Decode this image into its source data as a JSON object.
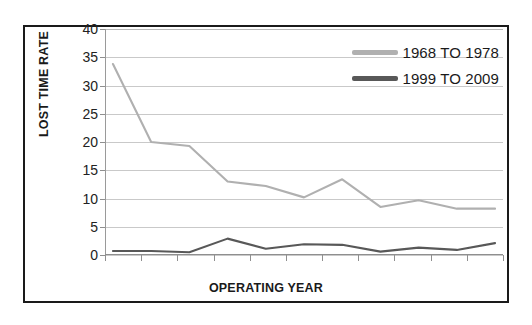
{
  "chart_data": {
    "type": "line",
    "title": "",
    "xlabel": "OPERATING YEAR",
    "ylabel": "LOST TIME RATE",
    "ylim": [
      0,
      40
    ],
    "ytick_values": [
      0,
      5,
      10,
      15,
      20,
      25,
      30,
      35,
      40
    ],
    "ytick_labels": [
      "0",
      "5",
      "10",
      "15",
      "20",
      "25",
      "30",
      "35",
      "40"
    ],
    "grid": true,
    "grid_axis": "y",
    "legend_position": "top-right",
    "x": [
      1,
      2,
      3,
      4,
      5,
      6,
      7,
      8,
      9,
      10,
      11
    ],
    "xtick_labels": [
      "",
      "",
      "",
      "",
      "",
      "",
      "",
      "",
      "",
      "",
      ""
    ],
    "series": [
      {
        "name": "1968 TO 1978",
        "color": "#b0b0b0",
        "values": [
          33.8,
          20.0,
          19.3,
          13.0,
          12.2,
          10.2,
          13.4,
          8.5,
          9.7,
          8.2,
          8.2
        ]
      },
      {
        "name": "1999 TO 2009",
        "color": "#585858",
        "values": [
          0.7,
          0.7,
          0.5,
          2.9,
          1.1,
          1.9,
          1.8,
          0.6,
          1.3,
          0.9,
          2.1
        ]
      }
    ]
  },
  "legend": {
    "items": [
      {
        "label": "1968 TO 1978",
        "color": "#b0b0b0"
      },
      {
        "label": "1999 TO 2009",
        "color": "#585858"
      }
    ]
  },
  "axes": {
    "x_title": "OPERATING YEAR",
    "y_title": "LOST TIME RATE"
  }
}
